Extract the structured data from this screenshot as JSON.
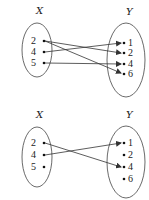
{
  "diagrams": [
    {
      "name": "relation-top",
      "domain_label": "X",
      "codomain_label": "Y",
      "domain": [
        "2",
        "4",
        "5"
      ],
      "codomain": [
        "1",
        "2",
        "4",
        "6"
      ],
      "mappings": [
        [
          "2",
          "2"
        ],
        [
          "2",
          "6"
        ],
        [
          "4",
          "1"
        ],
        [
          "5",
          "4"
        ]
      ]
    },
    {
      "name": "relation-bottom",
      "domain_label": "X",
      "codomain_label": "Y",
      "domain": [
        "2",
        "4",
        "5"
      ],
      "codomain": [
        "1",
        "2",
        "4",
        "6"
      ],
      "mappings": [
        [
          "2",
          "4"
        ],
        [
          "4",
          "1"
        ]
      ]
    }
  ],
  "colors": {
    "stroke": "#333333",
    "text": "#222222",
    "background": "#ffffff"
  }
}
